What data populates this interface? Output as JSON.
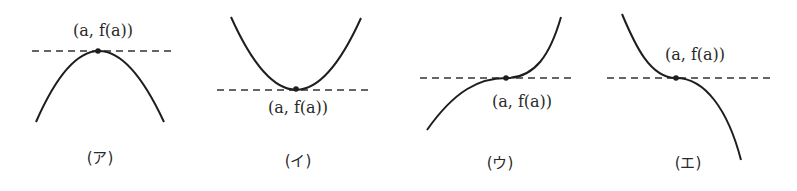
{
  "figure": {
    "point_label": "(a, f(a))",
    "graphs": [
      {
        "id": "a",
        "caption": "(ア)",
        "shape": "concave-down maximum",
        "label": "(a, f(a))"
      },
      {
        "id": "i",
        "caption": "(イ)",
        "shape": "concave-up minimum",
        "label": "(a, f(a))"
      },
      {
        "id": "u",
        "caption": "(ウ)",
        "shape": "increasing inflection with horizontal tangent",
        "label": "(a, f(a))"
      },
      {
        "id": "e",
        "caption": "(エ)",
        "shape": "decreasing inflection with horizontal tangent",
        "label": "(a, f(a))"
      }
    ],
    "colors": {
      "curve": "#1e1e1e",
      "tangent": "#333333",
      "text": "#2a2a2a"
    }
  }
}
